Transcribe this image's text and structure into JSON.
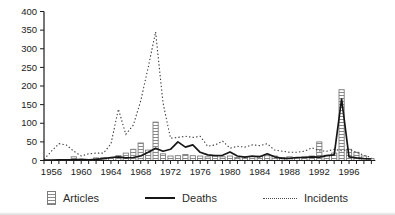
{
  "legend": {
    "items": [
      {
        "label": "Articles",
        "icon": "hatched-bar-swatch"
      },
      {
        "label": "Deaths",
        "icon": "solid-line-swatch"
      },
      {
        "label": "Incidents",
        "icon": "dotted-line-swatch"
      }
    ]
  },
  "chart_data": {
    "type": "mixed-bar-line",
    "title": "",
    "xlabel": "",
    "ylabel": "",
    "x_min": 1955,
    "x_max": 1999,
    "ylim": [
      0,
      400
    ],
    "y_tick_step": 50,
    "y_tick_labels": [
      "0",
      "50",
      "100",
      "150",
      "200",
      "250",
      "300",
      "350",
      "400"
    ],
    "x_tick_labels": [
      "1956",
      "1960",
      "1964",
      "1968",
      "1972",
      "1976",
      "1980",
      "1984",
      "1988",
      "1992",
      "1996"
    ],
    "x_label_years": [
      1956,
      1960,
      1964,
      1968,
      1972,
      1976,
      1980,
      1984,
      1988,
      1992,
      1996
    ],
    "grid": false,
    "legend_position": "bottom",
    "years": [
      1955,
      1956,
      1957,
      1958,
      1959,
      1960,
      1961,
      1962,
      1963,
      1964,
      1965,
      1966,
      1967,
      1968,
      1969,
      1970,
      1971,
      1972,
      1973,
      1974,
      1975,
      1976,
      1977,
      1978,
      1979,
      1980,
      1981,
      1982,
      1983,
      1984,
      1985,
      1986,
      1987,
      1988,
      1989,
      1990,
      1991,
      1992,
      1993,
      1994,
      1995,
      1996,
      1997,
      1998,
      1999
    ],
    "series": [
      {
        "name": "Articles",
        "type": "bar",
        "style": "hatched",
        "values": [
          0,
          0,
          0,
          0,
          10,
          0,
          0,
          7,
          8,
          8,
          13,
          20,
          30,
          47,
          28,
          103,
          18,
          12,
          13,
          16,
          13,
          12,
          10,
          12,
          10,
          12,
          8,
          10,
          10,
          12,
          13,
          12,
          8,
          10,
          8,
          10,
          12,
          50,
          14,
          20,
          190,
          30,
          22,
          12,
          5
        ]
      },
      {
        "name": "Deaths",
        "type": "line",
        "style": "solid",
        "values": [
          1,
          1,
          2,
          2,
          2,
          3,
          2,
          3,
          5,
          8,
          10,
          7,
          8,
          12,
          22,
          33,
          25,
          30,
          50,
          36,
          42,
          22,
          15,
          13,
          14,
          23,
          12,
          9,
          12,
          10,
          18,
          10,
          6,
          6,
          8,
          8,
          10,
          9,
          13,
          15,
          165,
          10,
          7,
          5,
          4
        ]
      },
      {
        "name": "Incidents",
        "type": "line",
        "style": "dotted",
        "values": [
          3,
          25,
          45,
          42,
          25,
          12,
          18,
          20,
          20,
          45,
          138,
          70,
          95,
          160,
          250,
          345,
          155,
          60,
          62,
          65,
          62,
          65,
          38,
          42,
          52,
          33,
          38,
          36,
          42,
          40,
          45,
          28,
          25,
          22,
          22,
          25,
          34,
          26,
          25,
          30,
          26,
          30,
          22,
          14,
          8
        ]
      }
    ],
    "colors": {
      "background": "#ffffff",
      "axis": "#1c1c1c",
      "tick_label": "#1c1c1c",
      "bar_fill": "#ffffff",
      "bar_hatch": "#8a8a8a",
      "bar_outline": "#7d7d7d",
      "deaths_line": "#161616",
      "incidents_line": "#3f3f3f"
    }
  }
}
